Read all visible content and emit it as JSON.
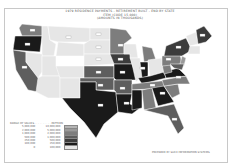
{
  "map": {
    "title_lines": [
      "1979 RESIDENCE PAYMENTS - RETIREMENT BUILT - END BY STATE",
      "ITEM (CODE 15,000)",
      "(AMOUNTS IN THOUSANDS)"
    ],
    "legend": {
      "header": "RANGE OF VALUES  . . . . . . . . . .  PATTERN",
      "rows": [
        {
          "low": "5,000,000",
          "high": "10,000,000",
          "color": "#b5b5b5"
        },
        {
          "low": "2,000,000",
          "high": "5,000,000",
          "color": "#9a9a9a"
        },
        {
          "low": "1,000,000",
          "high": "2,000,000",
          "color": "#7d7d7d"
        },
        {
          "low": "500,000",
          "high": "1,000,000",
          "color": "#5e5e5e"
        },
        {
          "low": "250,000",
          "high": "500,000",
          "color": "#3c3c3c"
        },
        {
          "low": "100,000",
          "high": "250,000",
          "color": "#1a1a1a"
        },
        {
          "low": "0",
          "high": "100,000",
          "color": "#e6e6e6"
        }
      ]
    },
    "credit": "PREPARED BY SLICE INFORMATION SYSTEMS"
  }
}
